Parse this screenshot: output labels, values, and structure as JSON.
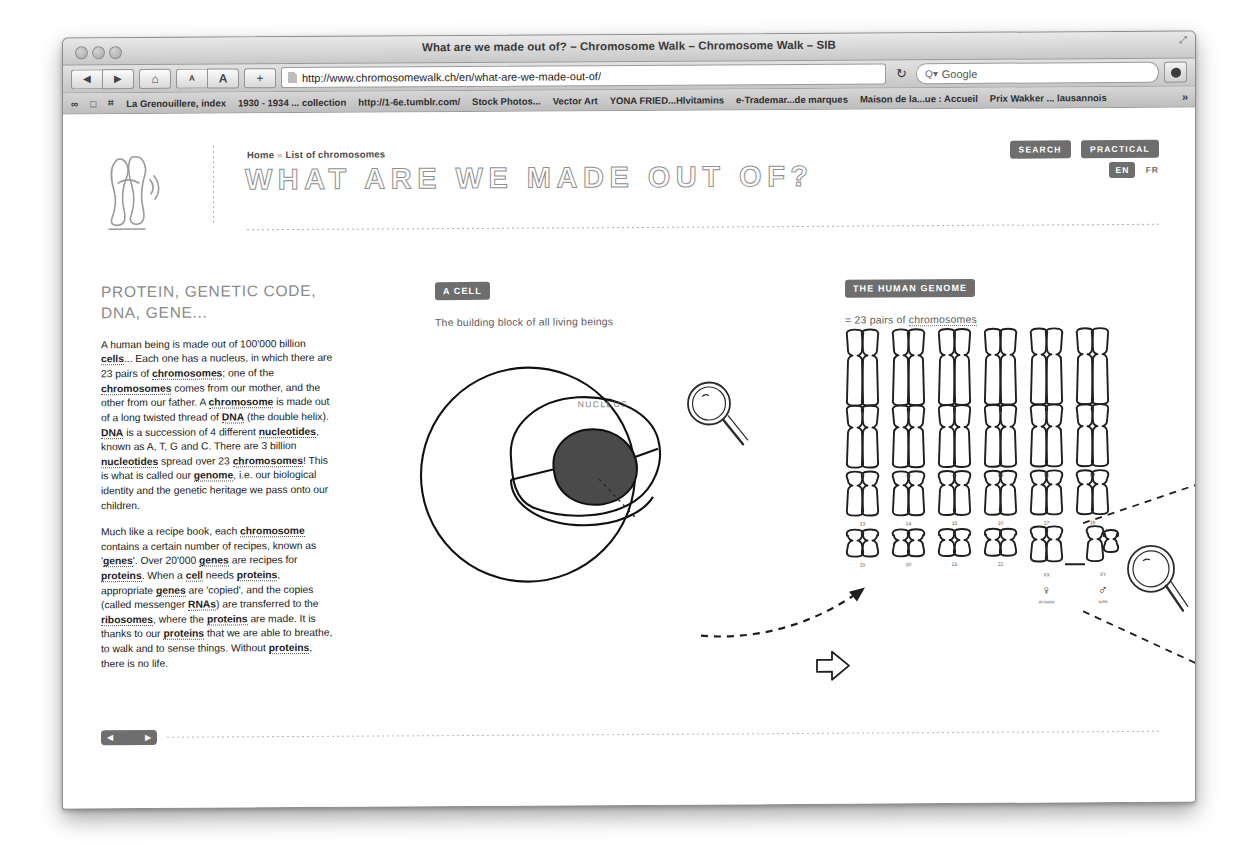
{
  "browser": {
    "window_title": "What are we made out of? – Chromosome Walk – Chromosome Walk – SIB",
    "url": "http://www.chromosomewalk.ch/en/what-are-we-made-out-of/",
    "search_placeholder": "Google",
    "back_icon": "◀",
    "forward_icon": "▶",
    "home_icon": "⌂",
    "font_small_label": "A",
    "font_large_label": "A",
    "add_label": "+",
    "reload_icon": "↻",
    "search_icon": "Q▾",
    "bookmark_icons": [
      "∞",
      "□",
      "⌗"
    ],
    "bookmarks": [
      "La Grenouillere, index",
      "1930 - 1934 ... collection",
      "http://1-6e.tumblr.com/",
      "Stock Photos...",
      "Vector Art",
      "YONA FRIED...Hlvitamins",
      "e-Trademar...de marques",
      "Maison de la...ue : Accueil",
      "Prix Wakker ... lausannois"
    ],
    "overflow_icon": "»"
  },
  "header": {
    "breadcrumb_home": "Home",
    "breadcrumb_sep": "»",
    "breadcrumb_current": "List of chromosomes",
    "title": "WHAT ARE WE MADE OUT OF?",
    "search_button": "SEARCH",
    "practical_button": "PRACTICAL",
    "lang_active": "EN",
    "lang_other": "FR"
  },
  "left_column": {
    "heading": "PROTEIN, GENETIC CODE, DNA, GENE...",
    "paragraph1_parts": [
      {
        "t": "A human being is made out of 100'000 billion ",
        "b": false
      },
      {
        "t": "cells",
        "b": true
      },
      {
        "t": "... Each one has a nucleus, in which there are 23 pairs of ",
        "b": false
      },
      {
        "t": "chromosomes",
        "b": true
      },
      {
        "t": "; one of the ",
        "b": false
      },
      {
        "t": "chromosomes",
        "b": true
      },
      {
        "t": " comes from our mother, and the other from our father. A ",
        "b": false
      },
      {
        "t": "chromosome",
        "b": true
      },
      {
        "t": " is made out of a long twisted thread of ",
        "b": false
      },
      {
        "t": "DNA",
        "b": true
      },
      {
        "t": " (the double helix). ",
        "b": false
      },
      {
        "t": "DNA",
        "b": true
      },
      {
        "t": " is a succession of 4 different ",
        "b": false
      },
      {
        "t": "nucleotides",
        "b": true
      },
      {
        "t": ", known as A, T, G and C. There are 3 billion ",
        "b": false
      },
      {
        "t": "nucleotides",
        "b": true
      },
      {
        "t": " spread over 23 ",
        "b": false
      },
      {
        "t": "chromosomes",
        "b": true
      },
      {
        "t": "! This is what is called our ",
        "b": false
      },
      {
        "t": "genome",
        "b": true
      },
      {
        "t": ", i.e. our biological identity and the genetic heritage we pass onto our children.",
        "b": false
      }
    ],
    "paragraph2_parts": [
      {
        "t": "Much like a recipe book, each ",
        "b": false
      },
      {
        "t": "chromosome",
        "b": true
      },
      {
        "t": " contains a certain number of recipes, known as '",
        "b": false
      },
      {
        "t": "genes",
        "b": true
      },
      {
        "t": "'. Over 20'000 ",
        "b": false
      },
      {
        "t": "genes",
        "b": true
      },
      {
        "t": " are recipes for ",
        "b": false
      },
      {
        "t": "proteins",
        "b": true
      },
      {
        "t": ". When a ",
        "b": false
      },
      {
        "t": "cell",
        "b": true
      },
      {
        "t": " needs ",
        "b": false
      },
      {
        "t": "proteins",
        "b": true
      },
      {
        "t": ", appropriate ",
        "b": false
      },
      {
        "t": "genes",
        "b": true
      },
      {
        "t": " are 'copied', and the copies (called messenger ",
        "b": false
      },
      {
        "t": "RNAs",
        "b": true
      },
      {
        "t": ") are transferred to the ",
        "b": false
      },
      {
        "t": "ribosomes",
        "b": true
      },
      {
        "t": ", where the ",
        "b": false
      },
      {
        "t": "proteins",
        "b": true
      },
      {
        "t": " are made. It is thanks to our ",
        "b": false
      },
      {
        "t": "proteins",
        "b": true
      },
      {
        "t": " that we are able to breathe, to walk and to sense things. Without ",
        "b": false
      },
      {
        "t": "proteins",
        "b": true
      },
      {
        "t": ", there is no life.",
        "b": false
      }
    ]
  },
  "cell_section": {
    "label": "A CELL",
    "subtitle": "The building block of all living beings",
    "nucleus_label": "NUCLEUS"
  },
  "genome_section": {
    "label": "THE HUMAN GENOME",
    "subtitle_prefix": "= 23 pairs of ",
    "subtitle_term": "chromosomes",
    "chromosome_numbers": [
      "1",
      "2",
      "3",
      "4",
      "5",
      "6",
      "7",
      "8",
      "9",
      "10",
      "11",
      "12",
      "13",
      "14",
      "15",
      "16",
      "17",
      "18",
      "19",
      "20",
      "21",
      "22"
    ],
    "sex_pair_labels": [
      "XX",
      "XY"
    ],
    "female_symbol": "♀",
    "female_label": "WOMAN",
    "male_symbol": "♂",
    "male_label": "MAN"
  },
  "footer": {
    "prev_icon": "◀",
    "next_icon": "▶"
  },
  "colors": {
    "accent_gray": "#6e6e6e",
    "title_stroke": "#8f8f8f",
    "text": "#1c1c1c",
    "nucleus_fill": "#4a4a4a"
  }
}
